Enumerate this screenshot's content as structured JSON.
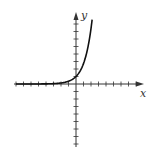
{
  "chart_data": {
    "type": "line",
    "title": "",
    "xlabel": "x",
    "ylabel": "y",
    "function": "y = e^x",
    "xlim": [
      -8,
      8.5
    ],
    "ylim": [
      -8.5,
      9
    ],
    "grid": false,
    "legend": null,
    "x_ticks": [
      -8,
      -7,
      -6,
      -5,
      -4,
      -3,
      -2,
      -1,
      1,
      2,
      3,
      4,
      5,
      6,
      7,
      8
    ],
    "y_ticks": [
      -8,
      -7,
      -6,
      -5,
      -4,
      -3,
      -2,
      -1,
      1,
      2,
      3,
      4,
      5,
      6,
      7,
      8
    ],
    "series": [
      {
        "name": "exponential curve",
        "x": [
          -8,
          -6,
          -4,
          -3,
          -2,
          -1,
          -0.5,
          0,
          0.5,
          1,
          1.5,
          1.8,
          2.0,
          2.15
        ],
        "y": [
          0.0003,
          0.0025,
          0.018,
          0.05,
          0.135,
          0.37,
          0.61,
          1.0,
          1.65,
          2.72,
          4.48,
          6.05,
          7.39,
          8.58
        ]
      }
    ],
    "colors": {
      "axis": "#333333",
      "curve": "#111111"
    }
  }
}
